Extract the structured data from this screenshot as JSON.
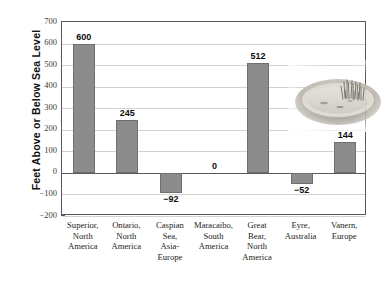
{
  "chart_data": {
    "type": "bar",
    "title": "",
    "xlabel": "",
    "ylabel": "Feet Above or Below Sea Level",
    "ylim": [
      -200,
      700
    ],
    "ytick_step": 100,
    "grid": true,
    "legend": "none",
    "orientation": "vertical",
    "bar_color": "#8c8c8c",
    "bar_edge_color": "#6f6f6f",
    "categories": [
      "Superior,\nNorth\nAmerica",
      "Ontario,\nNorth\nAmerica",
      "Caspian\nSea,\nAsia-\nEurope",
      "Maracaibo,\nSouth\nAmerica",
      "Great\nBear,\nNorth\nAmerica",
      "Eyre,\nAustralia",
      "Vanern,\nEurope"
    ],
    "values": [
      600,
      245,
      -92,
      0,
      512,
      -52,
      144
    ],
    "data_labels": [
      "600",
      "245",
      "−92",
      "0",
      "512",
      "−52",
      "144"
    ],
    "ytick_labels": [
      "700",
      "600",
      "500",
      "400",
      "300",
      "200",
      "100",
      "0",
      "−100",
      "−200"
    ],
    "ytick_values": [
      700,
      600,
      500,
      400,
      300,
      200,
      100,
      0,
      -100,
      -200
    ]
  },
  "axis": {
    "ylabel": "Feet Above or Below Sea Level"
  },
  "categories": [
    {
      "lines": [
        "Superior,",
        "North",
        "America"
      ]
    },
    {
      "lines": [
        "Ontario,",
        "North",
        "America"
      ]
    },
    {
      "lines": [
        "Caspian",
        "Sea,",
        "Asia-",
        "Europe"
      ]
    },
    {
      "lines": [
        "Maracaibo,",
        "South",
        "America"
      ]
    },
    {
      "lines": [
        "Great",
        "Bear,",
        "North",
        "America"
      ]
    },
    {
      "lines": [
        "Eyre,",
        "Australia"
      ]
    },
    {
      "lines": [
        "Vanern,",
        "Europe"
      ]
    }
  ],
  "inset": {
    "name": "lake-basin-photo",
    "description": "faded photograph of a shallow lake basin with reeds",
    "water_color": "#cfcdc6",
    "shore_color": "#b4b0a6",
    "reed_color": "#4e4c46"
  }
}
